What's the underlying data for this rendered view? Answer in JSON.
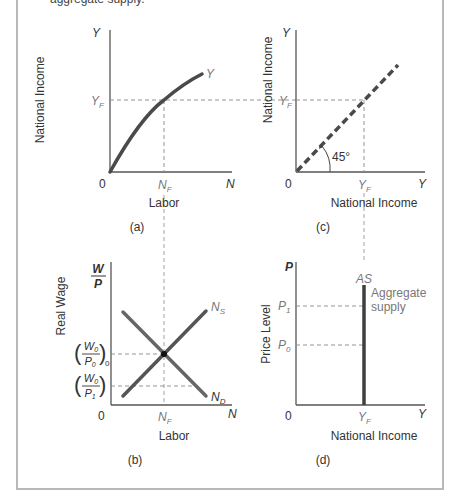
{
  "caption_fragment": "aggregate supply.",
  "panels": {
    "a": {
      "tag": "(a)",
      "y_axis_title": "National Income",
      "y_axis_symbol": "Y",
      "x_axis_title": "Labor",
      "x_axis_symbol": "N",
      "origin": "0",
      "y_tick": "Y",
      "y_tick_sub": "F",
      "x_tick": "N",
      "x_tick_sub": "F",
      "curve_label": "Y"
    },
    "c": {
      "tag": "(c)",
      "y_axis_title": "National Income",
      "y_axis_symbol": "Y",
      "x_axis_title": "National Income",
      "x_axis_symbol": "Y",
      "origin": "0",
      "y_tick": "Y",
      "y_tick_sub": "F",
      "x_tick": "Y",
      "x_tick_sub": "F",
      "angle_label": "45°"
    },
    "b": {
      "tag": "(b)",
      "y_axis_title": "Real Wage",
      "y_axis_num": "W",
      "y_axis_den": "P",
      "x_axis_title": "Labor",
      "x_axis_symbol": "N",
      "origin": "0",
      "x_tick": "N",
      "x_tick_sub": "F",
      "wage_high_num": "W",
      "wage_high_num_sub": "0",
      "wage_high_den": "P",
      "wage_high_den_sub": "0",
      "wage_high_outer_sub": "0",
      "wage_low_num": "W",
      "wage_low_num_sub": "0",
      "wage_low_den": "P",
      "wage_low_den_sub": "1",
      "supply_label": "N",
      "supply_sub": "S",
      "demand_label": "N",
      "demand_sub": "D"
    },
    "d": {
      "tag": "(d)",
      "y_axis_title": "Price Level",
      "y_axis_symbol": "P",
      "x_axis_title": "National Income",
      "x_axis_symbol": "Y",
      "origin": "0",
      "x_tick": "Y",
      "x_tick_sub": "F",
      "p1": "P",
      "p1_sub": "1",
      "p0": "P",
      "p0_sub": "0",
      "as_label": "AS",
      "as_desc_line1": "Aggregate",
      "as_desc_line2": "supply"
    }
  },
  "colors": {
    "curve": "#4a4a4a",
    "axis": "#555555",
    "dashed": "#888888",
    "frame": "#b9b9b9"
  }
}
